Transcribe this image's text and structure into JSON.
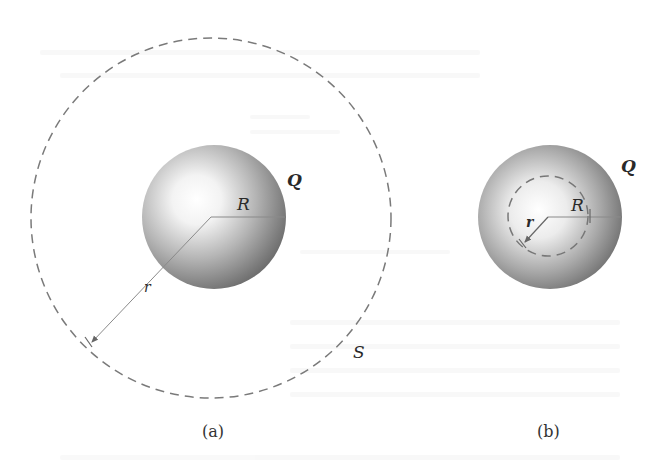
{
  "figure": {
    "type": "diagram",
    "colors": {
      "background": "#ffffff",
      "dashed_line": "#7a7a7a",
      "radius_line": "#8a8a8a",
      "sphere_highlight": "#ffffff",
      "sphere_shadow": "#6e6e6e",
      "label": "#2a2a2a"
    },
    "panels": [
      {
        "id": "a",
        "caption": "(a)",
        "sphere": {
          "charge_label": "Q",
          "radius_label": "R"
        },
        "gaussian_surface": {
          "label": "S",
          "radius_label": "r",
          "position": "outside sphere"
        }
      },
      {
        "id": "b",
        "caption": "(b)",
        "sphere": {
          "charge_label": "Q",
          "radius_label": "R"
        },
        "gaussian_surface": {
          "radius_label": "r",
          "position": "inside sphere"
        }
      }
    ]
  }
}
